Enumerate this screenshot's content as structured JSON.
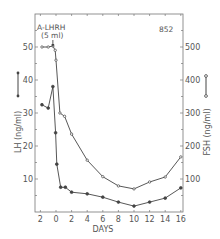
{
  "chart_data": {
    "type": "line",
    "title": "",
    "annotations": [
      {
        "text": "A-LHRH",
        "x": 37,
        "y": 30
      },
      {
        "text": "(5 ml)",
        "x": 41,
        "y": 38
      },
      {
        "text": "852",
        "x": 159,
        "y": 32
      }
    ],
    "xlabel": "DAYS",
    "ylabel_left": "LH (ng/ml)",
    "ylabel_right": "FSH (ng/ml)",
    "xlim": [
      -2,
      16
    ],
    "ylim_left": [
      0,
      60
    ],
    "ylim_right": [
      0,
      600
    ],
    "x_ticks": [
      -2,
      0,
      2,
      4,
      6,
      8,
      10,
      12,
      14,
      16
    ],
    "x_tick_labels": [
      "2",
      "0",
      "2",
      "4",
      "6",
      "8",
      "10",
      "12",
      "14",
      "16"
    ],
    "y_left_ticks": [
      10,
      20,
      30,
      40,
      50
    ],
    "y_right_ticks": [
      100,
      200,
      300,
      400,
      500
    ],
    "grid": false,
    "legend": "inline axis markers: filled dot line = LH (left), open circle line = FSH (right)",
    "series": [
      {
        "name": "LH",
        "axis": "left",
        "marker": "filled-circle",
        "x": [
          -1.8,
          -1.0,
          -0.4,
          -0.05,
          0.1,
          0.6,
          1.2,
          2.0,
          4.0,
          6.0,
          8.0,
          10.0,
          12.0,
          14.0,
          16.0
        ],
        "values": [
          32.5,
          31.5,
          38,
          24,
          14.5,
          7.5,
          7.5,
          6,
          5.5,
          4.5,
          3,
          1.8,
          3,
          4.2,
          7.3
        ]
      },
      {
        "name": "FSH",
        "axis": "right",
        "marker": "open-circle",
        "x": [
          -1.8,
          -1.0,
          -0.4,
          -0.1,
          0.0,
          0.5,
          1.1,
          2.0,
          4.0,
          6.0,
          8.0,
          10.0,
          12.0,
          14.0,
          16.0
        ],
        "values": [
          500,
          500,
          503,
          490,
          460,
          300,
          290,
          236,
          157,
          107,
          79,
          70,
          91,
          106,
          167
        ]
      }
    ]
  },
  "frame": {
    "left": 35,
    "right": 183,
    "top": 14,
    "bottom": 212
  },
  "mapping": {
    "x0_px": 56,
    "px_per_day": 7.8,
    "y0_px": 212,
    "px_per_lh": 3.3
  },
  "colors": {
    "line": "#444444",
    "axis": "#777777",
    "text": "#555555"
  }
}
